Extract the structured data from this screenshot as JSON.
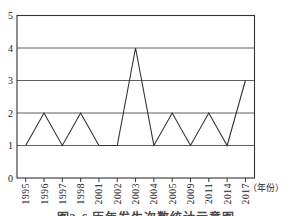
{
  "chart_data": {
    "type": "line",
    "title": "",
    "xlabel": "",
    "ylabel": "",
    "x_unit_label": "（年份）",
    "categories": [
      "1995",
      "1996",
      "1997",
      "1998",
      "2001",
      "2002",
      "2003",
      "2004",
      "2005",
      "2009",
      "2011",
      "2014",
      "2017"
    ],
    "values": [
      1,
      2,
      1,
      2,
      1,
      1,
      4,
      1,
      2,
      1,
      2,
      1,
      3
    ],
    "ylim": [
      0,
      5
    ],
    "yticks": [
      0,
      1,
      2,
      3,
      4,
      5
    ],
    "ytick_labels": [
      "0",
      "1",
      "2",
      "3",
      "4",
      "5"
    ],
    "grid": "horizontal",
    "legend": "none",
    "marker": "none",
    "colors": {
      "line": "#333333",
      "grid": "#4d4d4d",
      "axis": "#333333",
      "text": "#222222",
      "background": "#ffffff"
    }
  },
  "caption": {
    "text": "图3-6 历年发生次数统计示意图",
    "visibility": "partially cut off at bottom edge"
  }
}
